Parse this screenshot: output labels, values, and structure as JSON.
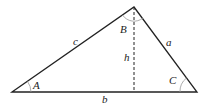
{
  "diagram": {
    "type": "triangle",
    "vertices": {
      "A": [
        12,
        92
      ],
      "B": [
        134,
        7
      ],
      "C": [
        197,
        92
      ]
    },
    "altitude_foot": [
      134,
      92
    ],
    "labels": {
      "side_c": "c",
      "side_a": "a",
      "side_b": "b",
      "angle_A": "A",
      "angle_B": "B",
      "angle_C": "C",
      "height": "h"
    },
    "colors": {
      "stroke": "#222222",
      "arc": "#999999"
    }
  }
}
